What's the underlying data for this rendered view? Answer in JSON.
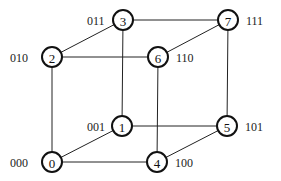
{
  "diagram": {
    "nodes": [
      {
        "id": "0",
        "label": "0",
        "binary": "000",
        "x": 52,
        "y": 162,
        "bin_x": 10,
        "bin_side": "left"
      },
      {
        "id": "1",
        "label": "1",
        "binary": "001",
        "x": 122,
        "y": 126,
        "bin_x": 87,
        "bin_side": "left"
      },
      {
        "id": "2",
        "label": "2",
        "binary": "010",
        "x": 52,
        "y": 57,
        "bin_x": 10,
        "bin_side": "left"
      },
      {
        "id": "3",
        "label": "3",
        "binary": "011",
        "x": 123,
        "y": 20,
        "bin_x": 87,
        "bin_side": "left"
      },
      {
        "id": "4",
        "label": "4",
        "binary": "100",
        "x": 157,
        "y": 162,
        "bin_x": 175,
        "bin_side": "right"
      },
      {
        "id": "5",
        "label": "5",
        "binary": "101",
        "x": 227,
        "y": 126,
        "bin_x": 245,
        "bin_side": "right"
      },
      {
        "id": "6",
        "label": "6",
        "binary": "110",
        "x": 158,
        "y": 57,
        "bin_x": 176,
        "bin_side": "right"
      },
      {
        "id": "7",
        "label": "7",
        "binary": "111",
        "x": 228,
        "y": 20,
        "bin_x": 246,
        "bin_side": "right"
      }
    ],
    "edges": [
      [
        "0",
        "1"
      ],
      [
        "0",
        "2"
      ],
      [
        "0",
        "4"
      ],
      [
        "1",
        "3"
      ],
      [
        "1",
        "5"
      ],
      [
        "2",
        "3"
      ],
      [
        "2",
        "6"
      ],
      [
        "3",
        "7"
      ],
      [
        "4",
        "5"
      ],
      [
        "4",
        "6"
      ],
      [
        "5",
        "7"
      ],
      [
        "6",
        "7"
      ]
    ],
    "node_radius": 10
  }
}
